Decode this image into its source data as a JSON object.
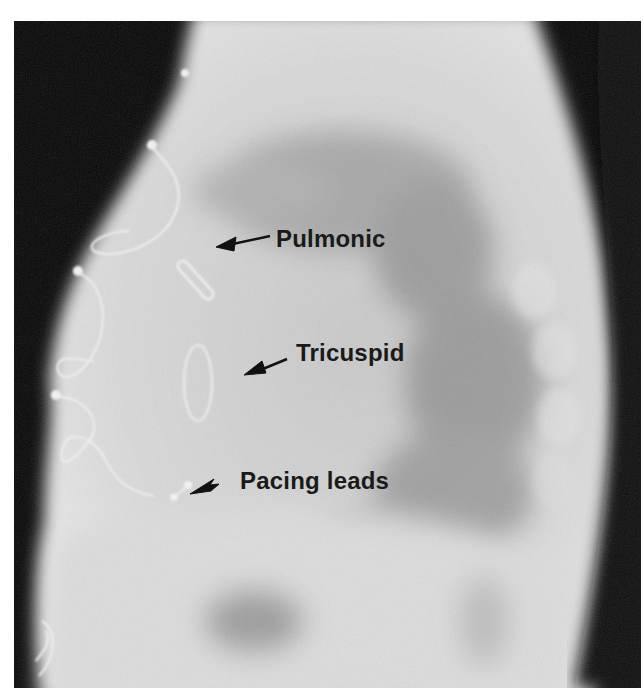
{
  "image": {
    "description": "Lateral chest radiograph showing prosthetic heart valves and pacing leads",
    "background_color": "#070707",
    "border_color": "#ffffff"
  },
  "annotations": [
    {
      "id": "pulmonic",
      "label": "Pulmonic",
      "arrow_direction": "left"
    },
    {
      "id": "tricuspid",
      "label": "Tricuspid",
      "arrow_direction": "left"
    },
    {
      "id": "pacing-leads",
      "label": "Pacing leads",
      "arrow_direction": "left"
    }
  ],
  "colors": {
    "label_text": "#1a1a1a",
    "arrow": "#111111",
    "soft_tissue": "#d6d6d6",
    "lung_shadow": "#8f8f8f",
    "wire": "#eeeeee"
  }
}
